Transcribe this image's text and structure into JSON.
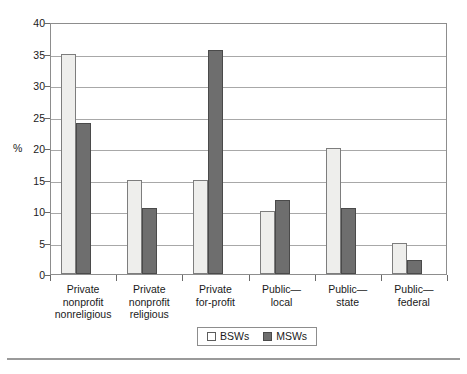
{
  "chart_data": {
    "type": "bar",
    "title": "",
    "xlabel": "",
    "ylabel": "%",
    "ylim": [
      0,
      40
    ],
    "yticks": [
      0,
      5,
      10,
      15,
      20,
      25,
      30,
      35,
      40
    ],
    "grid": true,
    "legend_position": "bottom",
    "categories": [
      "Private nonprofit nonreligious",
      "Private nonprofit religious",
      "Private for-profit",
      "Public—local",
      "Public—state",
      "Public—federal"
    ],
    "category_lines": [
      [
        "Private",
        "nonprofit",
        "nonreligious"
      ],
      [
        "Private",
        "nonprofit",
        "religious"
      ],
      [
        "Private",
        "for-profit"
      ],
      [
        "Public—",
        "local"
      ],
      [
        "Public—",
        "state"
      ],
      [
        "Public—",
        "federal"
      ]
    ],
    "series": [
      {
        "name": "BSWs",
        "color": "#eeeeec",
        "values": [
          35.0,
          15.0,
          15.0,
          10.0,
          20.0,
          5.0
        ]
      },
      {
        "name": "MSWs",
        "color": "#6e6e6e",
        "values": [
          24.0,
          10.5,
          35.5,
          11.8,
          10.5,
          2.3
        ]
      }
    ]
  },
  "axis": {
    "y_title": "%",
    "tick_labels": [
      "40",
      "35",
      "30",
      "25",
      "20",
      "15",
      "10",
      "5",
      "0"
    ]
  },
  "legend": {
    "entries": [
      {
        "label": "BSWs",
        "swatch": "light-square-swatch"
      },
      {
        "label": "MSWs",
        "swatch": "dark-square-swatch"
      }
    ]
  }
}
